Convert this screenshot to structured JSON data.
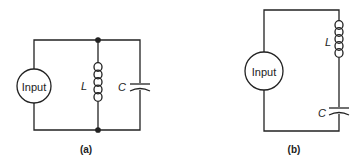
{
  "diagrams": [
    {
      "id": "a",
      "caption": "(a)",
      "type": "parallel LC circuit",
      "source_label": "Input",
      "inductor_label": "L",
      "capacitor_label": "C"
    },
    {
      "id": "b",
      "caption": "(b)",
      "type": "series LC circuit",
      "source_label": "Input",
      "inductor_label": "L",
      "capacitor_label": "C"
    }
  ]
}
